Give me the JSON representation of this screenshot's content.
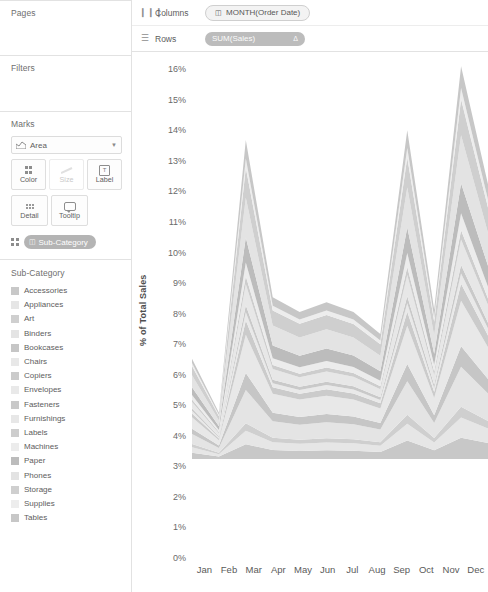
{
  "sidebar": {
    "pages": {
      "title": "Pages"
    },
    "filters": {
      "title": "Filters"
    },
    "marks": {
      "title": "Marks",
      "mark_type": "Area",
      "mark_type_icon": "area-chart-icon",
      "caret_icon": "chevron-down-icon",
      "buttons": [
        {
          "label": "Color",
          "icon": "color-dots-icon",
          "disabled": false
        },
        {
          "label": "Size",
          "icon": "size-icon",
          "disabled": true
        },
        {
          "label": "Label",
          "icon": "label-text-icon",
          "disabled": false
        },
        {
          "label": "Detail",
          "icon": "detail-dots-icon",
          "disabled": false
        },
        {
          "label": "Tooltip",
          "icon": "tooltip-icon",
          "disabled": false
        }
      ],
      "encoding_pill": {
        "label": "Sub-Category",
        "field_icon": "discrete-field-icon",
        "handle_icon": "color-dots-icon"
      }
    },
    "legend": {
      "title": "Sub-Category",
      "items": [
        {
          "label": "Accessories",
          "color": "#c8c8c8"
        },
        {
          "label": "Appliances",
          "color": "#e6e6e6"
        },
        {
          "label": "Art",
          "color": "#cfcfcf"
        },
        {
          "label": "Binders",
          "color": "#e4e4e4"
        },
        {
          "label": "Bookcases",
          "color": "#c6c6c6"
        },
        {
          "label": "Chairs",
          "color": "#e8e8e8"
        },
        {
          "label": "Copiers",
          "color": "#cbcbcb"
        },
        {
          "label": "Envelopes",
          "color": "#e9e9e9"
        },
        {
          "label": "Fasteners",
          "color": "#c9c9c9"
        },
        {
          "label": "Furnishings",
          "color": "#e7e7e7"
        },
        {
          "label": "Labels",
          "color": "#cdcdcd"
        },
        {
          "label": "Machines",
          "color": "#ececec"
        },
        {
          "label": "Paper",
          "color": "#bcbcbc"
        },
        {
          "label": "Phones",
          "color": "#e3e3e3"
        },
        {
          "label": "Storage",
          "color": "#cfcfcf"
        },
        {
          "label": "Supplies",
          "color": "#ededed"
        },
        {
          "label": "Tables",
          "color": "#c7c7c7"
        }
      ]
    }
  },
  "shelves": {
    "columns": {
      "name": "Columns",
      "icon": "columns-shelf-icon",
      "pill": "MONTH(Order Date)",
      "pill_icon": "calendar-field-icon"
    },
    "rows": {
      "name": "Rows",
      "icon": "rows-shelf-icon",
      "pill": "SUM(Sales)",
      "pill_badge": "delta-icon"
    }
  },
  "chart_data": {
    "type": "area",
    "stacked": true,
    "title": "",
    "xlabel": "",
    "ylabel": "% of Total Sales",
    "ylim": [
      0,
      16.5
    ],
    "ytick_labels": [
      "16%",
      "15%",
      "14%",
      "13%",
      "12%",
      "11%",
      "10%",
      "9%",
      "8%",
      "7%",
      "6%",
      "5%",
      "4%",
      "3%",
      "2%",
      "1%",
      "0%"
    ],
    "ytick_values": [
      16,
      15,
      14,
      13,
      12,
      11,
      10,
      9,
      8,
      7,
      6,
      5,
      4,
      3,
      2,
      1,
      0
    ],
    "grid": false,
    "legend_position": "left-sidebar",
    "categories": [
      "Jan",
      "Feb",
      "Mar",
      "Apr",
      "May",
      "Jun",
      "Jul",
      "Aug",
      "Sep",
      "Oct",
      "Nov",
      "Dec"
    ],
    "totals": [
      4.1,
      1.9,
      13.0,
      6.6,
      6.0,
      6.4,
      6.0,
      5.1,
      13.4,
      6.1,
      16.0,
      11.2
    ],
    "series": [
      {
        "name": "Accessories",
        "color": "#c8c8c8",
        "values": [
          0.3,
          0.12,
          0.62,
          0.4,
          0.36,
          0.4,
          0.38,
          0.32,
          0.8,
          0.4,
          0.92,
          0.7
        ]
      },
      {
        "name": "Appliances",
        "color": "#e6e6e6",
        "values": [
          0.26,
          0.1,
          0.55,
          0.34,
          0.3,
          0.34,
          0.32,
          0.27,
          0.72,
          0.34,
          0.86,
          0.62
        ]
      },
      {
        "name": "Art",
        "color": "#cfcfcf",
        "values": [
          0.14,
          0.06,
          0.3,
          0.19,
          0.17,
          0.19,
          0.18,
          0.15,
          0.38,
          0.19,
          0.46,
          0.33
        ]
      },
      {
        "name": "Binders",
        "color": "#e4e4e4",
        "values": [
          0.46,
          0.2,
          1.35,
          0.72,
          0.64,
          0.7,
          0.66,
          0.55,
          1.42,
          0.66,
          1.7,
          1.18
        ]
      },
      {
        "name": "Bookcases",
        "color": "#c6c6c6",
        "values": [
          0.24,
          0.1,
          0.7,
          0.36,
          0.32,
          0.36,
          0.33,
          0.28,
          0.74,
          0.34,
          0.88,
          0.62
        ]
      },
      {
        "name": "Chairs",
        "color": "#e8e8e8",
        "values": [
          0.52,
          0.22,
          1.55,
          0.82,
          0.74,
          0.8,
          0.75,
          0.63,
          1.62,
          0.75,
          1.94,
          1.36
        ]
      },
      {
        "name": "Copiers",
        "color": "#cbcbcb",
        "values": [
          0.18,
          0.08,
          0.58,
          0.28,
          0.25,
          0.28,
          0.26,
          0.22,
          0.6,
          0.27,
          0.72,
          0.5
        ]
      },
      {
        "name": "Envelopes",
        "color": "#e9e9e9",
        "values": [
          0.12,
          0.05,
          0.34,
          0.18,
          0.16,
          0.18,
          0.17,
          0.14,
          0.36,
          0.17,
          0.44,
          0.3
        ]
      },
      {
        "name": "Fasteners",
        "color": "#c9c9c9",
        "values": [
          0.1,
          0.04,
          0.28,
          0.15,
          0.13,
          0.15,
          0.14,
          0.12,
          0.3,
          0.14,
          0.36,
          0.25
        ]
      },
      {
        "name": "Furnishings",
        "color": "#e7e7e7",
        "values": [
          0.3,
          0.13,
          0.86,
          0.46,
          0.41,
          0.45,
          0.42,
          0.35,
          0.9,
          0.42,
          1.08,
          0.76
        ]
      },
      {
        "name": "Labels",
        "color": "#cdcdcd",
        "values": [
          0.12,
          0.05,
          0.32,
          0.17,
          0.15,
          0.17,
          0.16,
          0.13,
          0.34,
          0.16,
          0.4,
          0.28
        ]
      },
      {
        "name": "Machines",
        "color": "#ececec",
        "values": [
          0.2,
          0.08,
          0.56,
          0.3,
          0.27,
          0.29,
          0.27,
          0.23,
          0.6,
          0.28,
          0.72,
          0.5
        ]
      },
      {
        "name": "Paper",
        "color": "#bcbcbc",
        "values": [
          0.36,
          0.16,
          1.02,
          0.55,
          0.49,
          0.54,
          0.5,
          0.42,
          1.08,
          0.5,
          1.28,
          0.9
        ]
      },
      {
        "name": "Phones",
        "color": "#e3e3e3",
        "values": [
          0.54,
          0.24,
          1.62,
          0.86,
          0.77,
          0.84,
          0.79,
          0.66,
          1.7,
          0.79,
          2.04,
          1.42
        ]
      },
      {
        "name": "Storage",
        "color": "#cfcfcf",
        "values": [
          0.42,
          0.18,
          1.22,
          0.65,
          0.58,
          0.63,
          0.59,
          0.5,
          1.28,
          0.6,
          1.54,
          1.08
        ]
      },
      {
        "name": "Supplies",
        "color": "#ededed",
        "values": [
          0.14,
          0.06,
          0.38,
          0.2,
          0.18,
          0.2,
          0.19,
          0.16,
          0.4,
          0.19,
          0.48,
          0.34
        ]
      },
      {
        "name": "Tables",
        "color": "#c7c7c7",
        "values": [
          0.2,
          0.09,
          0.75,
          0.37,
          0.32,
          0.36,
          0.33,
          0.28,
          0.76,
          0.35,
          0.92,
          0.66
        ]
      }
    ]
  }
}
